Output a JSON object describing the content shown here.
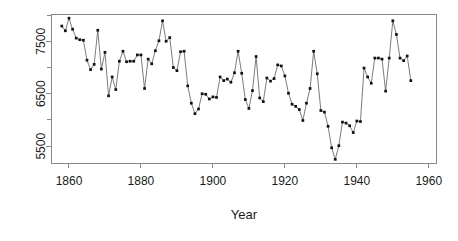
{
  "chart_data": {
    "type": "line",
    "title": "",
    "xlabel": "Year",
    "ylabel": "",
    "xlim": [
      1855,
      1962
    ],
    "ylim": [
      5180,
      8020
    ],
    "grid": false,
    "legend": null,
    "xticks": [
      1860,
      1880,
      1900,
      1920,
      1940,
      1960
    ],
    "xtick_labels": [
      "1860",
      "1880",
      "1900",
      "1920",
      "1940",
      "1960"
    ],
    "yticks": [
      5500,
      6500,
      7500
    ],
    "ytick_labels": [
      "5500",
      "6500",
      "7500"
    ],
    "yminorticks": [
      6000,
      7000,
      8000
    ],
    "marker": "filled-square",
    "series": [
      {
        "name": "series-1",
        "x": [
          1858,
          1859,
          1860,
          1861,
          1862,
          1863,
          1864,
          1865,
          1866,
          1867,
          1868,
          1869,
          1870,
          1871,
          1872,
          1873,
          1874,
          1875,
          1876,
          1877,
          1878,
          1879,
          1880,
          1881,
          1882,
          1883,
          1884,
          1885,
          1886,
          1887,
          1888,
          1889,
          1890,
          1891,
          1892,
          1893,
          1894,
          1895,
          1896,
          1897,
          1898,
          1899,
          1900,
          1901,
          1902,
          1903,
          1904,
          1905,
          1906,
          1907,
          1908,
          1909,
          1910,
          1911,
          1912,
          1913,
          1914,
          1915,
          1916,
          1917,
          1918,
          1919,
          1920,
          1921,
          1922,
          1923,
          1924,
          1925,
          1926,
          1927,
          1928,
          1929,
          1930,
          1931,
          1932,
          1933,
          1934,
          1935,
          1936,
          1937,
          1938,
          1939,
          1940,
          1941,
          1942,
          1943,
          1944,
          1945,
          1946,
          1947,
          1948,
          1949,
          1950,
          1951,
          1952,
          1953,
          1954,
          1955
        ],
        "values": [
          7790,
          7700,
          7940,
          7730,
          7560,
          7530,
          7520,
          7140,
          6960,
          7060,
          7710,
          6970,
          7290,
          6460,
          6820,
          6580,
          7120,
          7310,
          7110,
          7120,
          7120,
          7240,
          7240,
          6600,
          7160,
          7070,
          7320,
          7510,
          7890,
          7500,
          7570,
          7000,
          6940,
          7300,
          7310,
          6650,
          6320,
          6120,
          6210,
          6500,
          6490,
          6400,
          6440,
          6430,
          6820,
          6750,
          6780,
          6720,
          6900,
          7310,
          6890,
          6390,
          6220,
          6560,
          7210,
          6420,
          6350,
          6800,
          6740,
          6790,
          7050,
          7030,
          6840,
          6510,
          6300,
          6260,
          6200,
          5990,
          6320,
          6600,
          7310,
          6880,
          6180,
          6150,
          5880,
          5470,
          5250,
          5510,
          5960,
          5940,
          5890,
          5760,
          5980,
          5970,
          6990,
          6820,
          6700,
          7180,
          7180,
          7160,
          6550,
          7180,
          7890,
          7630,
          7180,
          7130,
          7220,
          6750
        ]
      }
    ]
  },
  "axes": {
    "x_title": "Year"
  }
}
